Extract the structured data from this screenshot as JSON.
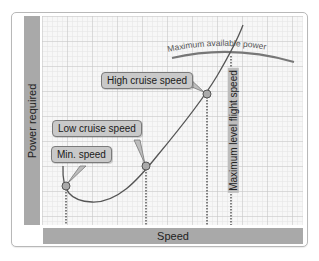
{
  "diagram": {
    "y_axis_label": "Power required",
    "x_axis_label": "Speed",
    "available_power_label": "Maximum available power",
    "max_level_label": "Maximum level flight speed",
    "callouts": {
      "min_speed": "Min. speed",
      "low_cruise": "Low cruise speed",
      "high_cruise": "High cruise speed"
    },
    "colors": {
      "axis_bar": "#a9a9a9",
      "callout_fill": "#c9c9c9",
      "curve": "#555555",
      "grid_minor": "#e2e2e2",
      "grid_major": "#c4c4c4"
    }
  }
}
